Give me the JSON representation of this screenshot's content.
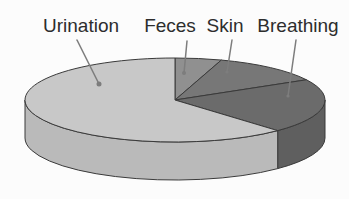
{
  "figure": {
    "description_labels": [
      "Urination",
      "Feces",
      "Skin",
      "Breathing"
    ]
  },
  "chart_data": {
    "type": "pie",
    "title": "",
    "legend": "none",
    "style": "3d-extruded-pie, grayscale scanned textbook figure",
    "background": "#fcfcfc",
    "outline_color": "#3a3a3a",
    "leader_line_color": "#7d7d7d",
    "label_text_color": "#2d2d2d",
    "clockwise_order": [
      1,
      2,
      3,
      0
    ],
    "geometry": {
      "cx": 175,
      "cy": 100,
      "rx": 150,
      "ry": 42,
      "depth": 38,
      "start_angle_deg": 90,
      "direction": "clockwise-from-top"
    },
    "slices": [
      {
        "id": "urination",
        "label": "Urination",
        "value": 62,
        "unit": "percent-estimated",
        "top_color": "#c8c8c8",
        "wall_color": "#bababa",
        "label_x": 81,
        "label_y": 16,
        "leader": {
          "x1": 77,
          "y1": 40,
          "x2": 99,
          "y2": 84,
          "dot_r": 2.5
        }
      },
      {
        "id": "feces",
        "label": "Feces",
        "value": 5,
        "unit": "percent-estimated",
        "top_color": "#909090",
        "wall_color": "#808080",
        "label_x": 170,
        "label_y": 16,
        "leader": {
          "x1": 187,
          "y1": 41,
          "x2": 184,
          "y2": 73,
          "dot_r": 2.0
        }
      },
      {
        "id": "skin",
        "label": "Skin",
        "value": 12,
        "unit": "percent-estimated",
        "top_color": "#777777",
        "wall_color": "#696969",
        "label_x": 225,
        "label_y": 16,
        "leader": {
          "x1": 232,
          "y1": 40,
          "x2": 227,
          "y2": 72,
          "dot_r": 1.6
        }
      },
      {
        "id": "breathing",
        "label": "Breathing",
        "value": 21,
        "unit": "percent-estimated",
        "top_color": "#6b6b6b",
        "wall_color": "#5f5f5f",
        "label_x": 298,
        "label_y": 16,
        "leader": {
          "x1": 296,
          "y1": 40,
          "x2": 288,
          "y2": 96,
          "dot_r": 1.6
        }
      }
    ]
  }
}
